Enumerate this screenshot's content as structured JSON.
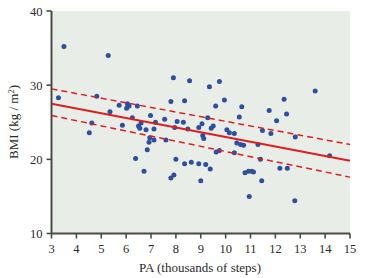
{
  "figure": {
    "background_color": "#ffffff",
    "plot_background_color": "#e8eee7",
    "axis_color": "#4a4a4a",
    "point_color": "#2e4f9e",
    "line_color": "#dd1f1f"
  },
  "chart_data": {
    "type": "scatter",
    "title": "",
    "xlabel": "PA (thousands of steps)",
    "ylabel_main": "BMI (kg / m",
    "ylabel_sup": "2",
    "ylabel_close": ")",
    "ylabel_full": "BMI (kg / m2)",
    "xlim": [
      3,
      15
    ],
    "ylim": [
      10,
      40
    ],
    "xticks": [
      3,
      4,
      5,
      6,
      7,
      8,
      9,
      10,
      11,
      12,
      13,
      14,
      15
    ],
    "xtick_labels": [
      "3",
      "4",
      "5",
      "6",
      "7",
      "8",
      "9",
      "10",
      "11",
      "12",
      "13",
      "14",
      "15"
    ],
    "yticks": [
      10,
      20,
      30,
      40
    ],
    "ytick_labels": [
      "10",
      "20",
      "30",
      "40"
    ],
    "grid": false,
    "legend": false,
    "points": [
      [
        3.5,
        35.2
      ],
      [
        5.28,
        34.0
      ],
      [
        7.9,
        31.0
      ],
      [
        8.55,
        30.6
      ],
      [
        9.75,
        30.5
      ],
      [
        9.35,
        29.8
      ],
      [
        13.6,
        29.2
      ],
      [
        3.28,
        28.3
      ],
      [
        4.82,
        28.5
      ],
      [
        12.35,
        28.1
      ],
      [
        9.95,
        28.0
      ],
      [
        8.35,
        27.9
      ],
      [
        7.8,
        27.8
      ],
      [
        6.05,
        27.5
      ],
      [
        6.12,
        27.2
      ],
      [
        6.02,
        26.9
      ],
      [
        6.45,
        27.2
      ],
      [
        9.6,
        27.2
      ],
      [
        10.65,
        27.1
      ],
      [
        5.35,
        26.4
      ],
      [
        11.75,
        26.6
      ],
      [
        5.72,
        27.3
      ],
      [
        12.45,
        26.1
      ],
      [
        12.05,
        25.2
      ],
      [
        6.98,
        25.9
      ],
      [
        7.55,
        25.4
      ],
      [
        6.25,
        25.6
      ],
      [
        10.55,
        25.7
      ],
      [
        9.28,
        25.6
      ],
      [
        8.05,
        25.1
      ],
      [
        8.3,
        25.0
      ],
      [
        4.62,
        24.9
      ],
      [
        5.85,
        24.6
      ],
      [
        7.18,
        25.0
      ],
      [
        6.6,
        24.9
      ],
      [
        9.05,
        24.8
      ],
      [
        6.5,
        24.5
      ],
      [
        6.55,
        24.2
      ],
      [
        9.5,
        24.5
      ],
      [
        9.42,
        24.2
      ],
      [
        8.92,
        24.3
      ],
      [
        10.05,
        24.0
      ],
      [
        6.8,
        24.0
      ],
      [
        7.12,
        24.1
      ],
      [
        7.95,
        24.3
      ],
      [
        8.48,
        24.1
      ],
      [
        11.48,
        23.9
      ],
      [
        11.82,
        23.5
      ],
      [
        4.52,
        23.6
      ],
      [
        10.35,
        23.5
      ],
      [
        10.15,
        23.6
      ],
      [
        9.08,
        23.2
      ],
      [
        9.12,
        22.8
      ],
      [
        12.8,
        23.0
      ],
      [
        6.95,
        22.9
      ],
      [
        7.12,
        22.6
      ],
      [
        6.92,
        22.3
      ],
      [
        7.6,
        22.6
      ],
      [
        10.45,
        22.2
      ],
      [
        10.6,
        22.0
      ],
      [
        10.72,
        21.9
      ],
      [
        11.3,
        22.0
      ],
      [
        6.85,
        21.3
      ],
      [
        9.75,
        21.2
      ],
      [
        9.62,
        21.0
      ],
      [
        10.35,
        20.9
      ],
      [
        14.18,
        20.5
      ],
      [
        11.4,
        20.0
      ],
      [
        8.0,
        20.0
      ],
      [
        6.38,
        20.1
      ],
      [
        8.62,
        19.6
      ],
      [
        8.92,
        19.4
      ],
      [
        9.2,
        19.3
      ],
      [
        8.35,
        19.4
      ],
      [
        9.38,
        18.7
      ],
      [
        10.92,
        18.4
      ],
      [
        11.05,
        18.4
      ],
      [
        11.12,
        18.3
      ],
      [
        10.78,
        18.2
      ],
      [
        12.18,
        18.8
      ],
      [
        12.48,
        18.8
      ],
      [
        6.72,
        18.4
      ],
      [
        7.92,
        17.9
      ],
      [
        7.8,
        17.5
      ],
      [
        11.45,
        17.1
      ],
      [
        9.0,
        17.1
      ],
      [
        10.95,
        15.0
      ],
      [
        12.78,
        14.4
      ]
    ],
    "regression_line": {
      "label": "fitted regression line",
      "style": "solid",
      "x": [
        3,
        15
      ],
      "y": [
        27.5,
        19.8
      ]
    },
    "confidence_bands": [
      {
        "label": "upper confidence band",
        "style": "dashed",
        "x": [
          3,
          15
        ],
        "y": [
          29.5,
          22.0
        ]
      },
      {
        "label": "lower confidence band",
        "style": "dashed",
        "x": [
          3,
          15
        ],
        "y": [
          25.9,
          17.6
        ]
      }
    ]
  }
}
